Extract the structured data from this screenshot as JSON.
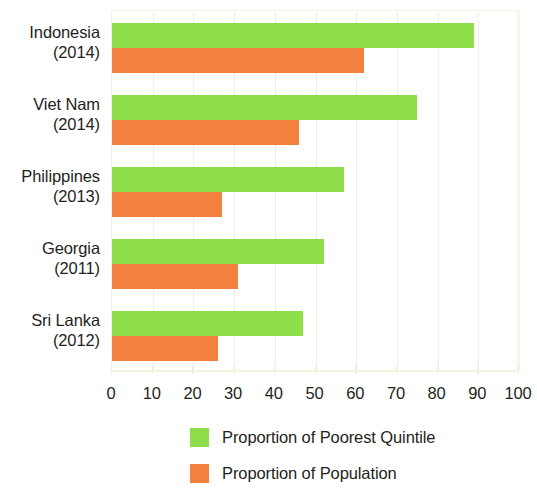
{
  "chart_data": {
    "type": "bar",
    "orientation": "horizontal",
    "title": "",
    "subtitle": "",
    "xlabel": "",
    "ylabel": "",
    "xlim": [
      0,
      100
    ],
    "xticks": [
      0,
      10,
      20,
      30,
      40,
      50,
      60,
      70,
      80,
      90,
      100
    ],
    "xtick_labels": [
      "0",
      "10",
      "20",
      "30",
      "40",
      "50",
      "60",
      "70",
      "80",
      "90",
      "100"
    ],
    "grid": true,
    "grid_axis": "x",
    "legend_position": "bottom",
    "categories": [
      "Indonesia\n(2014)",
      "Viet Nam\n(2014)",
      "Philippines\n(2013)",
      "Georgia\n(2011)",
      "Sri Lanka\n(2012)"
    ],
    "category_rows": [
      {
        "name": "Indonesia",
        "year": "(2014)"
      },
      {
        "name": "Viet Nam",
        "year": "(2014)"
      },
      {
        "name": "Philippines",
        "year": "(2013)"
      },
      {
        "name": "Georgia",
        "year": "(2011)"
      },
      {
        "name": "Sri Lanka",
        "year": "(2012)"
      }
    ],
    "series": [
      {
        "name": "Proportion of Poorest Quintile",
        "color": "#8ede4c",
        "values": [
          89,
          75,
          57,
          52,
          47
        ]
      },
      {
        "name": "Proportion of Population",
        "color": "#f4803f",
        "values": [
          62,
          46,
          27,
          31,
          26
        ]
      }
    ]
  },
  "legend": {
    "items": [
      {
        "label": "Proportion of Poorest Quintile",
        "color": "#8ede4c"
      },
      {
        "label": "Proportion of Population",
        "color": "#f4803f"
      }
    ]
  },
  "colors": {
    "green": "#8ede4c",
    "orange": "#f4803f",
    "gridline": "#f0f0e0",
    "text": "#231f20",
    "background": "#ffffff"
  }
}
